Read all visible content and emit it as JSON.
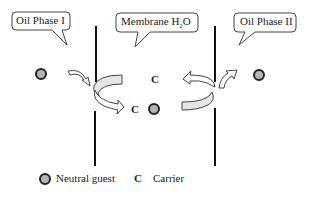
{
  "callouts": {
    "oil_phase_1": "Oil Phase I",
    "membrane": "Membrane H",
    "membrane_sub": "2",
    "membrane_suffix": "O",
    "oil_phase_2": "Oil Phase II"
  },
  "labels": {
    "carrier_top": "C",
    "carrier_bottom": "C"
  },
  "legend": {
    "guest_label": "Neutral guest",
    "carrier_symbol": "C",
    "carrier_label": "Carrier"
  },
  "colors": {
    "guest_fill": "#b3b3b3",
    "guest_stroke": "#222222",
    "arrow_fill": "#e6e6e6",
    "line": "#111111"
  }
}
